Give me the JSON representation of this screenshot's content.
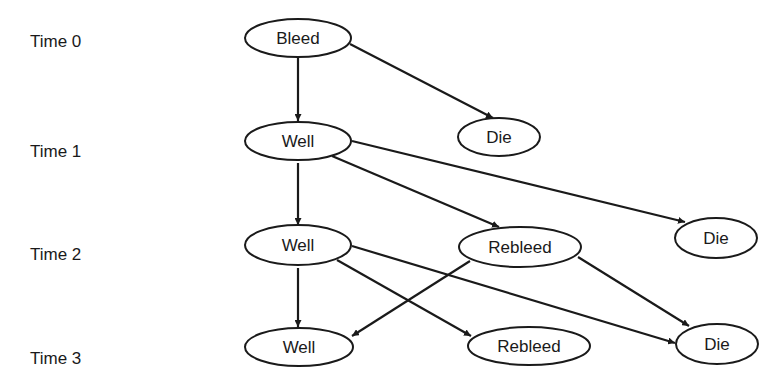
{
  "diagram": {
    "type": "state-transition-diagram",
    "colors": {
      "stroke": "#1a1a1a",
      "background": "#ffffff",
      "node_fill": "#ffffff"
    },
    "time_labels": [
      {
        "label": "Time 0",
        "x": 30,
        "y": 47
      },
      {
        "label": "Time 1",
        "x": 30,
        "y": 157
      },
      {
        "label": "Time 2",
        "x": 30,
        "y": 260
      },
      {
        "label": "Time 3",
        "x": 30,
        "y": 364
      }
    ],
    "nodes": [
      {
        "id": "bleed-t0",
        "label": "Bleed",
        "cx": 298,
        "cy": 38,
        "rx": 53,
        "ry": 19
      },
      {
        "id": "die-t0",
        "label": "Die",
        "cx": 499,
        "cy": 137,
        "rx": 41,
        "ry": 19
      },
      {
        "id": "well-t1",
        "label": "Well",
        "cx": 298,
        "cy": 141,
        "rx": 53,
        "ry": 19
      },
      {
        "id": "well-t2",
        "label": "Well",
        "cx": 298,
        "cy": 245,
        "rx": 53,
        "ry": 20
      },
      {
        "id": "rebleed-t2",
        "label": "Rebleed",
        "cx": 520,
        "cy": 247,
        "rx": 61,
        "ry": 20
      },
      {
        "id": "die-t1",
        "label": "Die",
        "cx": 716,
        "cy": 238,
        "rx": 41,
        "ry": 20
      },
      {
        "id": "well-t3",
        "label": "Well",
        "cx": 299,
        "cy": 347,
        "rx": 54,
        "ry": 19
      },
      {
        "id": "rebleed-t3",
        "label": "Rebleed",
        "cx": 529,
        "cy": 346,
        "rx": 61,
        "ry": 19
      },
      {
        "id": "die-t3",
        "label": "Die",
        "cx": 717,
        "cy": 344,
        "rx": 41,
        "ry": 20
      }
    ],
    "edges": [
      {
        "from": "bleed-t0",
        "to": "well-t1",
        "x1": 298,
        "y1": 57,
        "x2": 298,
        "y2": 121
      },
      {
        "from": "bleed-t0",
        "to": "die-t0",
        "x1": 350,
        "y1": 44,
        "x2": 493,
        "y2": 118
      },
      {
        "from": "well-t1",
        "to": "well-t2",
        "x1": 298,
        "y1": 163,
        "x2": 298,
        "y2": 225
      },
      {
        "from": "well-t1",
        "to": "rebleed-t2",
        "x1": 332,
        "y1": 156,
        "x2": 499,
        "y2": 227
      },
      {
        "from": "well-t1",
        "to": "die-t1",
        "x1": 352,
        "y1": 141,
        "x2": 685,
        "y2": 222
      },
      {
        "from": "well-t2",
        "to": "well-t3",
        "x1": 298,
        "y1": 268,
        "x2": 298,
        "y2": 327
      },
      {
        "from": "well-t2",
        "to": "rebleed-t3",
        "x1": 337,
        "y1": 260,
        "x2": 471,
        "y2": 336
      },
      {
        "from": "well-t2",
        "to": "die-t3",
        "x1": 352,
        "y1": 246,
        "x2": 675,
        "y2": 343
      },
      {
        "from": "rebleed-t2",
        "to": "well-t3",
        "x1": 470,
        "y1": 261,
        "x2": 352,
        "y2": 336
      },
      {
        "from": "rebleed-t2",
        "to": "die-t3",
        "x1": 578,
        "y1": 257,
        "x2": 689,
        "y2": 326
      }
    ]
  }
}
